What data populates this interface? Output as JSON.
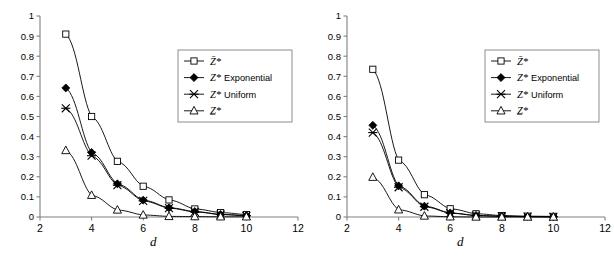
{
  "figure": {
    "panels": [
      {
        "name": "left-panel",
        "chart_data": {
          "type": "line",
          "title": "",
          "xlabel": "d",
          "ylabel": "",
          "xlim": [
            2,
            12
          ],
          "ylim": [
            0,
            1
          ],
          "xticks": [
            2,
            4,
            6,
            8,
            10,
            12
          ],
          "xticklabels": [
            "2",
            "4",
            "6",
            "8",
            "10",
            "12"
          ],
          "yticks": [
            0,
            0.1,
            0.2,
            0.3,
            0.4,
            0.5,
            0.6,
            0.7,
            0.8,
            0.9,
            1
          ],
          "yticklabels": [
            "0",
            "0.1",
            "0.2",
            "0.3",
            "0.4",
            "0.5",
            "0.6",
            "0.7",
            "0.8",
            "0.9",
            "1"
          ],
          "grid": false,
          "legend_position": "upper right",
          "x": [
            3,
            4,
            5,
            6,
            7,
            8,
            9,
            10
          ],
          "series": [
            {
              "name": "Z-upper-star",
              "label": "Z*",
              "accent": "Z̄*",
              "marker": "open-square",
              "values": [
                0.91,
                0.5,
                0.277,
                0.153,
                0.085,
                0.04,
                0.022,
                0.012
              ]
            },
            {
              "name": "Z-star-exponential",
              "label": "Z* Exponential",
              "accent": "Z*",
              "marker": "filled-diamond",
              "values": [
                0.642,
                0.321,
                0.165,
                0.084,
                0.046,
                0.027,
                0.013,
                0.007
              ]
            },
            {
              "name": "Z-star-uniform",
              "label": "Z* Uniform",
              "accent": "Z*",
              "marker": "cross-x",
              "values": [
                0.541,
                0.305,
                0.158,
                0.08,
                0.044,
                0.025,
                0.012,
                0.006
              ]
            },
            {
              "name": "Z-lower-star",
              "label": "Z*",
              "accent": "Z̲*",
              "marker": "open-triangle",
              "values": [
                0.331,
                0.108,
                0.035,
                0.01,
                0.003,
                0.002,
                0.001,
                0.001
              ]
            }
          ]
        }
      },
      {
        "name": "right-panel",
        "chart_data": {
          "type": "line",
          "title": "",
          "xlabel": "d",
          "ylabel": "",
          "xlim": [
            2,
            12
          ],
          "ylim": [
            0,
            1
          ],
          "xticks": [
            2,
            4,
            6,
            8,
            10,
            12
          ],
          "xticklabels": [
            "2",
            "4",
            "6",
            "8",
            "10",
            "12"
          ],
          "yticks": [
            0,
            0.1,
            0.2,
            0.3,
            0.4,
            0.5,
            0.6,
            0.7,
            0.8,
            0.9,
            1
          ],
          "yticklabels": [
            "0",
            "0.1",
            "0.2",
            "0.3",
            "0.4",
            "0.5",
            "0.6",
            "0.7",
            "0.8",
            "0.9",
            "1"
          ],
          "grid": false,
          "legend_position": "upper right",
          "x": [
            3,
            4,
            5,
            6,
            7,
            8,
            9,
            10
          ],
          "series": [
            {
              "name": "Z-upper-star",
              "label": "Z*",
              "accent": "Z̄*",
              "marker": "open-square",
              "values": [
                0.735,
                0.283,
                0.111,
                0.041,
                0.016,
                0.007,
                0.004,
                0.003
              ]
            },
            {
              "name": "Z-star-exponential",
              "label": "Z* Exponential",
              "accent": "Z*",
              "marker": "filled-diamond",
              "values": [
                0.456,
                0.155,
                0.054,
                0.02,
                0.008,
                0.004,
                0.002,
                0.001
              ]
            },
            {
              "name": "Z-star-uniform",
              "label": "Z* Uniform",
              "accent": "Z*",
              "marker": "cross-x",
              "values": [
                0.42,
                0.148,
                0.051,
                0.019,
                0.007,
                0.003,
                0.002,
                0.001
              ]
            },
            {
              "name": "Z-lower-star",
              "label": "Z*",
              "accent": "Z̲*",
              "marker": "open-triangle",
              "values": [
                0.198,
                0.036,
                0.005,
                0.001,
                0.0,
                0.0,
                0.0,
                0.0
              ]
            }
          ]
        }
      }
    ],
    "colors": {
      "line": "#000000",
      "axis": "#808080",
      "text": "#000000",
      "background": "#ffffff",
      "legend_border": "#808080"
    }
  }
}
